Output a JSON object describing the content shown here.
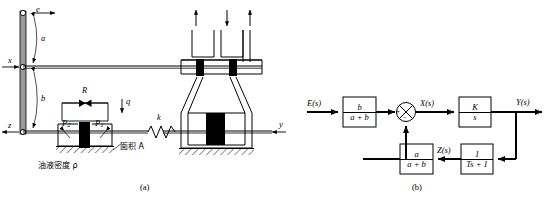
{
  "figure": {
    "panel_a": {
      "caption": "(a)",
      "labels": {
        "e": "e",
        "x": "x",
        "z": "z",
        "y": "y",
        "a": "a",
        "b": "b",
        "R": "R",
        "q": "q",
        "k": "k",
        "P1": "P",
        "P1_sub": "1",
        "P2": "P",
        "P2_sub": "2",
        "oil_density": "油液密度 ρ",
        "area": "面积 A"
      }
    },
    "panel_b": {
      "caption": "(b)",
      "signals": {
        "input": "E(s)",
        "after_sum": "X(s)",
        "output": "Y(s)",
        "feedback": "Z(s)"
      },
      "summing_junction": {
        "plus": "+",
        "minus": "−"
      },
      "blocks": [
        {
          "name": "input-gain",
          "num": "b",
          "den": "a + b"
        },
        {
          "name": "integrator",
          "num": "K",
          "den": "s"
        },
        {
          "name": "feedback-gain",
          "num": "a",
          "den": "a + b"
        },
        {
          "name": "lag",
          "num": "1",
          "den": "Ts + 1"
        }
      ]
    }
  },
  "colors": {
    "stroke": "#000000",
    "fill_solid": "#000000",
    "lever_fill": "#9a9a9a",
    "background": "#ffffff"
  }
}
